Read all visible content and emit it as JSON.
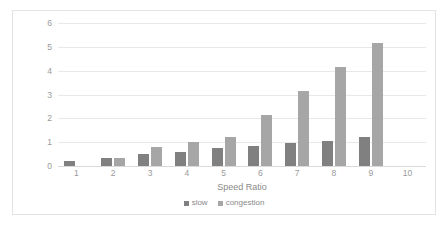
{
  "chart_data": {
    "type": "bar",
    "title": "",
    "xlabel": "Speed Ratio",
    "ylabel": "",
    "categories": [
      "1",
      "2",
      "3",
      "4",
      "5",
      "6",
      "7",
      "8",
      "9",
      "10"
    ],
    "series": [
      {
        "name": "slow",
        "color": "#808080",
        "values": [
          0.2,
          0.35,
          0.5,
          0.6,
          0.75,
          0.85,
          0.95,
          1.05,
          1.2,
          0
        ]
      },
      {
        "name": "congestion",
        "color": "#a6a6a6",
        "values": [
          0,
          0.35,
          0.8,
          1.0,
          1.2,
          2.15,
          3.15,
          4.15,
          5.15,
          0
        ]
      }
    ],
    "yticks": [
      "0",
      "1",
      "2",
      "3",
      "4",
      "5",
      "6"
    ],
    "ylim": [
      0,
      6
    ],
    "grid": true,
    "legend_position": "bottom"
  },
  "legend": {
    "entries": [
      {
        "label": "slow"
      },
      {
        "label": "congestion"
      }
    ]
  }
}
